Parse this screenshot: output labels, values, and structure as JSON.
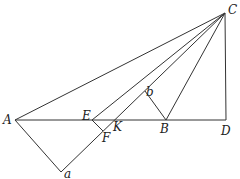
{
  "diagram": {
    "type": "geometric-construction",
    "points": {
      "C": {
        "label": "C",
        "x": 225,
        "y": 13
      },
      "A": {
        "label": "A",
        "x": 15,
        "y": 120
      },
      "D": {
        "label": "D",
        "x": 226,
        "y": 120
      },
      "E": {
        "label": "E",
        "x": 92,
        "y": 120
      },
      "K": {
        "label": "K",
        "x": 115,
        "y": 120
      },
      "B": {
        "label": "B",
        "x": 166,
        "y": 120
      },
      "F": {
        "label": "F",
        "x": 103,
        "y": 131
      },
      "b": {
        "label": "b",
        "x": 145,
        "y": 91
      },
      "a": {
        "label": "a",
        "x": 61,
        "y": 172
      }
    },
    "segments": [
      [
        "C",
        "A"
      ],
      [
        "C",
        "E"
      ],
      [
        "C",
        "a"
      ],
      [
        "C",
        "B"
      ],
      [
        "C",
        "D"
      ],
      [
        "A",
        "D"
      ],
      [
        "A",
        "a"
      ],
      [
        "E",
        "F"
      ],
      [
        "b",
        "B"
      ]
    ]
  }
}
